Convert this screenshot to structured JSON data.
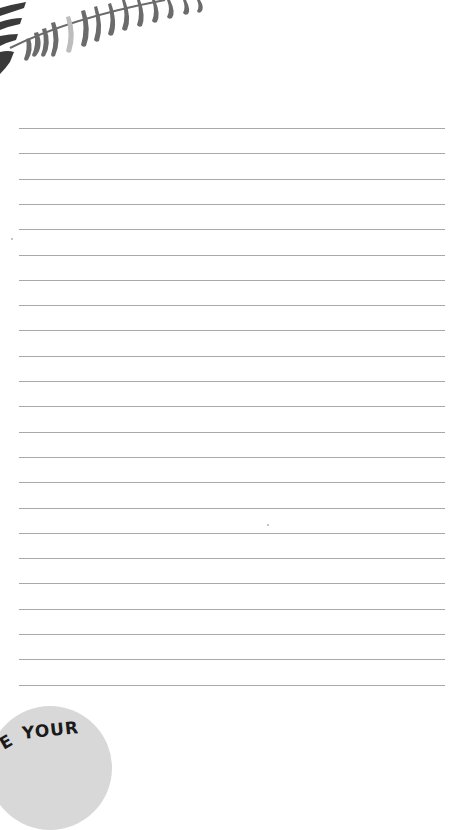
{
  "page": {
    "type": "lined-notes-page",
    "background": "#ffffff"
  },
  "decoration": {
    "top_left": "fern-leaf-illustration",
    "colors": {
      "leaf": "#6b6b6b",
      "leaf_light": "#bdbdbd",
      "leaf_dark": "#3a3a3a"
    }
  },
  "lines": {
    "count": 23,
    "first_y": 128,
    "spacing": 25.3,
    "x_start": 19,
    "x_end": 445,
    "color": "#a9a9a9"
  },
  "badge": {
    "prefix": "E",
    "text": "YOUR",
    "color": "#d8d8d8"
  }
}
